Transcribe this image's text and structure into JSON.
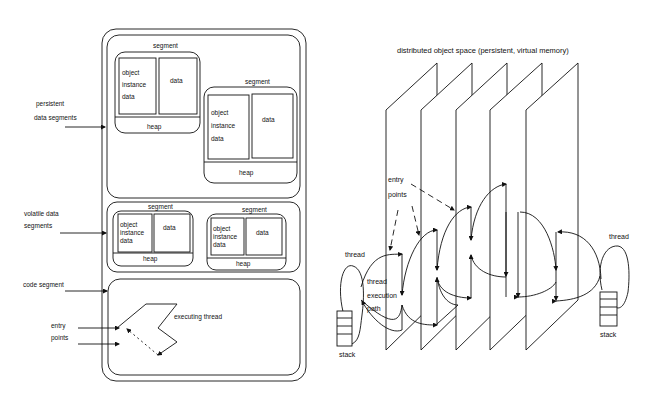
{
  "left_diagram": {
    "side_labels": {
      "persistent_line1": "persistent",
      "persistent_line2": "data segments",
      "volatile_line1": "volatile data",
      "volatile_line2": "segments",
      "code_segment": "code segment",
      "entry_line1": "entry",
      "entry_line2": "points"
    },
    "persistent_segments": [
      {
        "title": "segment",
        "object_l1": "object",
        "object_l2": "instance",
        "object_l3": "data",
        "data": "data",
        "heap": "heap"
      },
      {
        "title": "segment",
        "object_l1": "object",
        "object_l2": "instance",
        "object_l3": "data",
        "data": "data",
        "heap": "heap"
      }
    ],
    "volatile_segments": [
      {
        "title": "segment",
        "object_l1": "object",
        "object_l2": "instance",
        "object_l3": "data",
        "data": "data",
        "heap": "heap"
      },
      {
        "title": "segment",
        "object_l1": "object",
        "object_l2": "instance",
        "object_l3": "data",
        "data": "data",
        "heap": "heap"
      }
    ],
    "executing_thread": "executing thread"
  },
  "right_diagram": {
    "title": "distributed object space  (persistent, virtual memory)",
    "entry_line1": "entry",
    "entry_line2": "points",
    "left_thread": "thread",
    "left_stack": "stack",
    "path_line1": "thread",
    "path_line2": "execution",
    "path_line3": "path",
    "right_thread": "thread",
    "right_stack": "stack",
    "plane_count": 5
  },
  "colors": {
    "line": "#111111",
    "background": "#ffffff"
  }
}
